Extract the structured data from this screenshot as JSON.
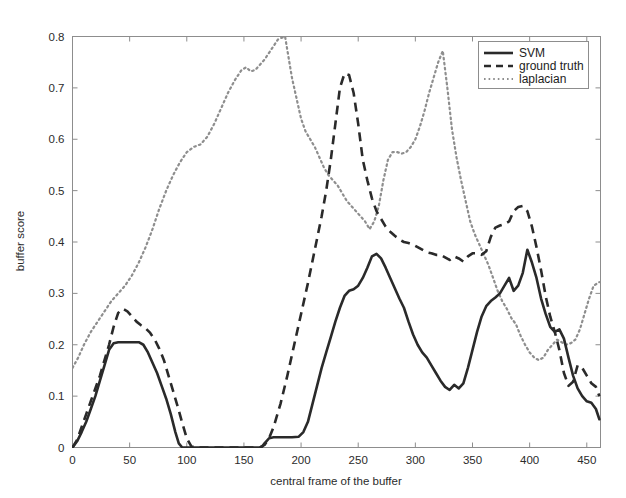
{
  "chart_data": {
    "type": "line",
    "title": "",
    "xlabel": "central frame of the buffer",
    "ylabel": "buffer score",
    "xlim": [
      0,
      462
    ],
    "ylim": [
      0,
      0.8
    ],
    "xticks": [
      0,
      50,
      100,
      150,
      200,
      250,
      300,
      350,
      400,
      450
    ],
    "yticks": [
      0,
      0.1,
      0.2,
      0.3,
      0.4,
      0.5,
      0.6,
      0.7,
      0.8
    ],
    "xtick_labels": [
      "0",
      "50",
      "100",
      "150",
      "200",
      "250",
      "300",
      "350",
      "400",
      "450"
    ],
    "ytick_labels": [
      "0",
      "0.1",
      "0.2",
      "0.3",
      "0.4",
      "0.5",
      "0.6",
      "0.7",
      "0.8"
    ],
    "grid": false,
    "legend_position": "upper right",
    "legend_entries": [
      "SVM",
      "ground truth",
      "laplacian"
    ],
    "series": [
      {
        "name": "SVM",
        "style": "solid",
        "color": "#2a2a2a",
        "x": [
          0,
          4,
          8,
          12,
          16,
          20,
          24,
          28,
          32,
          36,
          40,
          46,
          52,
          58,
          62,
          66,
          70,
          74,
          78,
          82,
          86,
          90,
          93,
          96,
          100,
          110,
          120,
          130,
          140,
          150,
          156,
          160,
          164,
          166,
          168,
          170,
          172,
          176,
          180,
          186,
          192,
          198,
          202,
          206,
          210,
          214,
          218,
          222,
          226,
          230,
          234,
          238,
          242,
          246,
          250,
          254,
          258,
          262,
          266,
          270,
          274,
          278,
          282,
          286,
          290,
          294,
          298,
          302,
          306,
          310,
          314,
          318,
          322,
          326,
          330,
          334,
          338,
          342,
          346,
          350,
          354,
          358,
          362,
          366,
          370,
          374,
          378,
          382,
          386,
          390,
          394,
          398,
          402,
          406,
          410,
          414,
          418,
          422,
          426,
          430,
          434,
          438,
          442,
          446,
          450,
          454,
          458,
          461
        ],
        "y": [
          0.0,
          0.012,
          0.03,
          0.05,
          0.075,
          0.1,
          0.13,
          0.16,
          0.19,
          0.203,
          0.205,
          0.205,
          0.205,
          0.205,
          0.2,
          0.185,
          0.165,
          0.145,
          0.12,
          0.095,
          0.065,
          0.03,
          0.008,
          0.0,
          0.0,
          0.0,
          0.0,
          0.0,
          0.0,
          0.0,
          0.0,
          0.0,
          0.0,
          0.002,
          0.008,
          0.013,
          0.018,
          0.02,
          0.02,
          0.02,
          0.02,
          0.021,
          0.03,
          0.05,
          0.085,
          0.12,
          0.155,
          0.185,
          0.215,
          0.245,
          0.272,
          0.295,
          0.305,
          0.308,
          0.315,
          0.33,
          0.35,
          0.372,
          0.377,
          0.368,
          0.35,
          0.33,
          0.31,
          0.29,
          0.272,
          0.245,
          0.22,
          0.2,
          0.185,
          0.175,
          0.16,
          0.145,
          0.13,
          0.118,
          0.112,
          0.122,
          0.115,
          0.125,
          0.155,
          0.19,
          0.225,
          0.255,
          0.275,
          0.285,
          0.292,
          0.3,
          0.315,
          0.33,
          0.305,
          0.315,
          0.34,
          0.385,
          0.36,
          0.33,
          0.29,
          0.26,
          0.235,
          0.225,
          0.23,
          0.212,
          0.175,
          0.14,
          0.115,
          0.1,
          0.09,
          0.087,
          0.075,
          0.055
        ]
      },
      {
        "name": "ground truth",
        "style": "dashed",
        "color": "#2a2a2a",
        "x": [
          0,
          4,
          8,
          12,
          16,
          20,
          24,
          28,
          32,
          36,
          40,
          44,
          48,
          52,
          56,
          60,
          64,
          68,
          72,
          76,
          80,
          84,
          88,
          92,
          96,
          100,
          104,
          110,
          120,
          130,
          140,
          150,
          155,
          160,
          164,
          168,
          172,
          176,
          182,
          188,
          194,
          200,
          206,
          212,
          218,
          222,
          226,
          230,
          234,
          238,
          242,
          246,
          250,
          254,
          258,
          262,
          266,
          270,
          274,
          278,
          282,
          286,
          290,
          294,
          298,
          302,
          306,
          310,
          314,
          318,
          322,
          326,
          330,
          334,
          338,
          342,
          346,
          350,
          354,
          358,
          362,
          366,
          370,
          374,
          378,
          382,
          386,
          390,
          394,
          398,
          402,
          406,
          410,
          414,
          418,
          422,
          426,
          430,
          434,
          438,
          442,
          446,
          450,
          454,
          458,
          461
        ],
        "y": [
          0.0,
          0.015,
          0.04,
          0.065,
          0.09,
          0.115,
          0.14,
          0.17,
          0.2,
          0.235,
          0.262,
          0.27,
          0.265,
          0.255,
          0.245,
          0.238,
          0.232,
          0.223,
          0.21,
          0.192,
          0.17,
          0.14,
          0.11,
          0.08,
          0.048,
          0.018,
          0.002,
          0.0,
          0.0,
          0.0,
          0.0,
          0.0,
          0.0,
          0.0,
          0.0,
          0.005,
          0.018,
          0.04,
          0.085,
          0.14,
          0.2,
          0.26,
          0.32,
          0.385,
          0.45,
          0.5,
          0.56,
          0.63,
          0.7,
          0.728,
          0.725,
          0.69,
          0.63,
          0.56,
          0.52,
          0.485,
          0.46,
          0.445,
          0.43,
          0.42,
          0.412,
          0.405,
          0.4,
          0.398,
          0.395,
          0.39,
          0.385,
          0.38,
          0.378,
          0.375,
          0.375,
          0.37,
          0.365,
          0.372,
          0.368,
          0.362,
          0.372,
          0.378,
          0.378,
          0.375,
          0.382,
          0.41,
          0.428,
          0.432,
          0.435,
          0.44,
          0.46,
          0.468,
          0.47,
          0.46,
          0.43,
          0.39,
          0.345,
          0.295,
          0.255,
          0.225,
          0.19,
          0.145,
          0.12,
          0.128,
          0.16,
          0.155,
          0.14,
          0.125,
          0.118,
          0.1
        ]
      },
      {
        "name": "laplacian",
        "style": "dotted",
        "color": "#8e8e8e",
        "x": [
          0,
          5,
          10,
          16,
          22,
          28,
          34,
          40,
          46,
          52,
          58,
          64,
          70,
          76,
          82,
          88,
          94,
          100,
          106,
          112,
          118,
          124,
          130,
          136,
          142,
          148,
          152,
          156,
          160,
          164,
          168,
          174,
          180,
          186,
          192,
          196,
          200,
          204,
          208,
          212,
          216,
          220,
          224,
          228,
          232,
          236,
          240,
          244,
          248,
          252,
          256,
          260,
          264,
          268,
          272,
          276,
          280,
          284,
          288,
          292,
          296,
          300,
          304,
          308,
          312,
          316,
          320,
          324,
          328,
          332,
          336,
          340,
          344,
          348,
          352,
          356,
          360,
          364,
          368,
          372,
          376,
          380,
          384,
          388,
          392,
          396,
          400,
          404,
          408,
          412,
          416,
          420,
          424,
          428,
          432,
          436,
          440,
          444,
          448,
          452,
          456,
          461
        ],
        "y": [
          0.155,
          0.175,
          0.2,
          0.225,
          0.245,
          0.265,
          0.285,
          0.3,
          0.315,
          0.335,
          0.36,
          0.39,
          0.425,
          0.465,
          0.5,
          0.53,
          0.555,
          0.575,
          0.585,
          0.59,
          0.605,
          0.63,
          0.66,
          0.69,
          0.715,
          0.735,
          0.74,
          0.732,
          0.735,
          0.745,
          0.755,
          0.775,
          0.795,
          0.8,
          0.72,
          0.68,
          0.64,
          0.615,
          0.6,
          0.585,
          0.565,
          0.545,
          0.53,
          0.52,
          0.51,
          0.495,
          0.48,
          0.47,
          0.46,
          0.45,
          0.44,
          0.425,
          0.44,
          0.47,
          0.52,
          0.56,
          0.575,
          0.575,
          0.572,
          0.575,
          0.585,
          0.6,
          0.625,
          0.655,
          0.69,
          0.72,
          0.75,
          0.772,
          0.7,
          0.62,
          0.565,
          0.52,
          0.48,
          0.44,
          0.415,
          0.395,
          0.375,
          0.355,
          0.33,
          0.305,
          0.285,
          0.27,
          0.252,
          0.24,
          0.218,
          0.2,
          0.185,
          0.175,
          0.17,
          0.175,
          0.19,
          0.2,
          0.21,
          0.205,
          0.2,
          0.203,
          0.21,
          0.23,
          0.26,
          0.29,
          0.315,
          0.322
        ]
      }
    ]
  },
  "axes": {
    "frame_color": "#8d8d8d"
  },
  "legend": {
    "items": [
      {
        "label": "SVM",
        "style": "solid"
      },
      {
        "label": "ground truth",
        "style": "dashed"
      },
      {
        "label": "laplacian",
        "style": "dotted"
      }
    ]
  }
}
